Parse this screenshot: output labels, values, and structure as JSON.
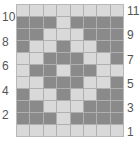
{
  "chart": {
    "title": "",
    "columns": 8,
    "rows": 11,
    "colors": {
      "light": "#d9d9d9",
      "dark": "#8a8a8a",
      "gridline": "#b0b0b0",
      "label": "#555555"
    },
    "row_numbers_left": [
      "10",
      "8",
      "6",
      "4",
      "2"
    ],
    "row_numbers_right": [
      "11",
      "9",
      "7",
      "5",
      "3",
      "1"
    ],
    "grid_top_to_bottom": [
      {
        "row": 11,
        "cells": "LLLLLLLL"
      },
      {
        "row": 10,
        "cells": "DDDLDDDD"
      },
      {
        "row": 9,
        "cells": "DDLLLDDD"
      },
      {
        "row": 8,
        "cells": "DLLDLLDD"
      },
      {
        "row": 7,
        "cells": "LLDDDLLD"
      },
      {
        "row": 6,
        "cells": "LDDLDDLL"
      },
      {
        "row": 5,
        "cells": "LLDDDLLD"
      },
      {
        "row": 4,
        "cells": "DLLDLLDD"
      },
      {
        "row": 3,
        "cells": "DDLLLDDD"
      },
      {
        "row": 2,
        "cells": "DDDLDDDD"
      },
      {
        "row": 1,
        "cells": "LLLLLLLL"
      }
    ]
  }
}
